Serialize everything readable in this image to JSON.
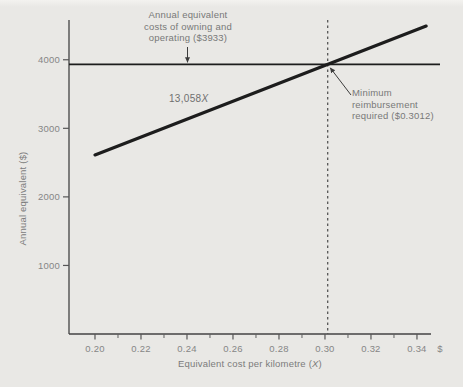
{
  "figure": {
    "background": "#e9e8e5",
    "axis_color": "#434343",
    "line_color": "#1d1d1d",
    "text_color": "#7b7b7b"
  },
  "labels": {
    "y_axis_title": "Annual equivalent ($)",
    "x_axis_title_prefix": "Equivalent cost per kilometre (",
    "x_axis_title_x": "X",
    "x_axis_title_suffix": ")",
    "slope_label_prefix": "13,058",
    "slope_label_x": "X"
  },
  "annotations": {
    "owning": {
      "lines": [
        "Annual equivalent",
        "costs of owning and",
        "operating ($3933)"
      ]
    },
    "minimum": {
      "lines": [
        "Minimum",
        "reimbursement",
        "required ($0.3012)"
      ]
    }
  },
  "chart_data": {
    "type": "line",
    "title": "",
    "xlabel": "Equivalent cost per kilometre (X)",
    "ylabel": "Annual equivalent ($)",
    "xlim": [
      0.1887,
      0.3461
    ],
    "ylim": [
      0,
      4580
    ],
    "grid": false,
    "legend": false,
    "x_tick_labels": [
      "0.20",
      "0.22",
      "0.24",
      "0.26",
      "0.28",
      "0.30",
      "0.32",
      "0.34"
    ],
    "x_minor_ticks": [
      0.21,
      0.23,
      0.25,
      0.27,
      0.29,
      0.31,
      0.33
    ],
    "x_axis_unit": "$",
    "y_tick_labels": [
      "1000",
      "2000",
      "3000",
      "4000"
    ],
    "series": [
      {
        "name": "Annual equivalent costs of owning and operating",
        "type": "hline",
        "value": 3933
      },
      {
        "name": "Reimbursement line 13,058X",
        "type": "linear",
        "slope": 13058,
        "intercept": 0,
        "x_start": 0.2,
        "x_end": 0.344
      }
    ],
    "vline": {
      "x": 0.3012,
      "style": "dashed"
    },
    "intersection": {
      "x": 0.3012,
      "y": 3933
    }
  }
}
